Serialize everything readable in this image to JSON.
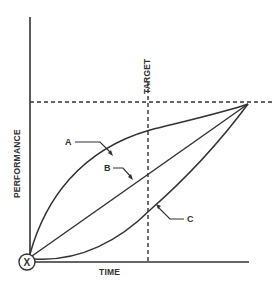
{
  "diagram": {
    "axes": {
      "x_label": "TIME",
      "y_label": "PERFORMANCE"
    },
    "target_label": "TARGET",
    "origin_label": "X",
    "curves": [
      {
        "label": "A",
        "shape": "concave (fast start, slow finish)"
      },
      {
        "label": "B",
        "shape": "linear"
      },
      {
        "label": "C",
        "shape": "convex (slow start, fast finish)"
      }
    ],
    "colors": {
      "line": "#333333",
      "background": "#ffffff"
    }
  }
}
